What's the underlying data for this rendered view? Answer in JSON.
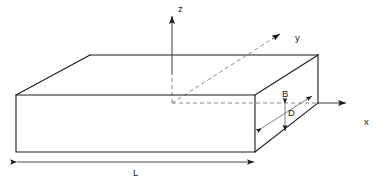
{
  "figure": {
    "name": "rectangular-slab-coordinate-diagram",
    "background_color": "#ffffff",
    "line_color": "#1a1a1a",
    "axis_color": "#3d3d3d",
    "dashed_color": "#8a8a8a",
    "dimension_color": "#6f6f6f"
  },
  "axes": {
    "z": {
      "label": "z",
      "label_x": 178,
      "label_y": 12
    },
    "y": {
      "label": "y",
      "label_x": 295,
      "label_y": 41
    },
    "x": {
      "label": "x",
      "label_x": 364,
      "label_y": 125
    }
  },
  "dimensions": {
    "length": {
      "label": "L",
      "label_x": 133,
      "label_y": 176
    },
    "breadth": {
      "label": "B",
      "label_x": 282,
      "label_y": 97
    },
    "depth": {
      "label": "D",
      "label_x": 288,
      "label_y": 116
    }
  }
}
